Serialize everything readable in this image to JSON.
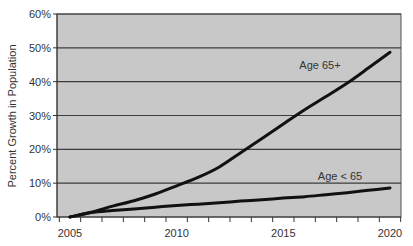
{
  "chart_data": {
    "type": "line",
    "title": "",
    "xlabel": "",
    "ylabel": "Percent Growth in Population",
    "x": [
      2005,
      2006,
      2007,
      2008,
      2009,
      2010,
      2011,
      2012,
      2013,
      2014,
      2015,
      2016,
      2017,
      2018,
      2019,
      2020
    ],
    "x_tick_labels": [
      "2005",
      "2010",
      "2015",
      "2020"
    ],
    "y_tick_labels": [
      "0%",
      "10%",
      "20%",
      "30%",
      "40%",
      "50%",
      "60%"
    ],
    "ylim": [
      0,
      60
    ],
    "grid": true,
    "legend": "inline labels",
    "series": [
      {
        "name": "Age 65+",
        "values": [
          0,
          1.4,
          3.2,
          4.8,
          6.8,
          9.2,
          11.7,
          14.8,
          19.0,
          23.2,
          27.5,
          31.7,
          35.6,
          39.6,
          44.1,
          48.7
        ]
      },
      {
        "name": "Age < 65",
        "values": [
          0,
          1.3,
          1.9,
          2.4,
          2.9,
          3.4,
          3.8,
          4.2,
          4.7,
          5.1,
          5.6,
          6.0,
          6.6,
          7.2,
          7.9,
          8.6
        ]
      }
    ]
  },
  "colors": {
    "plot_background": "#c8c8c8",
    "gridline": "#3c3c3c",
    "series_line": "#111111",
    "text": "#333333"
  }
}
